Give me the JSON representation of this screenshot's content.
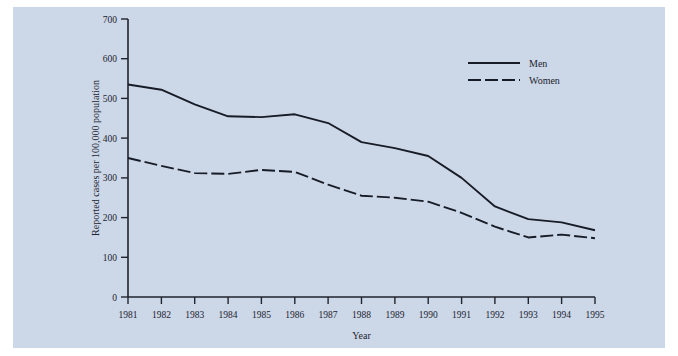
{
  "chart_data": {
    "type": "line",
    "title": "",
    "xlabel": "Year",
    "ylabel": "Reported cases per 100,000 population",
    "x": [
      1981,
      1982,
      1983,
      1984,
      1985,
      1986,
      1987,
      1988,
      1989,
      1990,
      1991,
      1992,
      1993,
      1994,
      1995
    ],
    "xtick_labels": [
      "1981",
      "1982",
      "1983",
      "1984",
      "1985",
      "1986",
      "1987",
      "1988",
      "1989",
      "1990",
      "1991",
      "1992",
      "1993",
      "1994",
      "1995"
    ],
    "ytick_labels": [
      "0",
      "100",
      "200",
      "300",
      "400",
      "500",
      "600",
      "700"
    ],
    "yticks": [
      0,
      100,
      200,
      300,
      400,
      500,
      600,
      700
    ],
    "ylim": [
      0,
      700
    ],
    "xlim": [
      1981,
      1995
    ],
    "grid": false,
    "legend_position": "top-right",
    "series": [
      {
        "name": "Men",
        "style": "solid",
        "values": [
          535,
          522,
          485,
          455,
          453,
          460,
          438,
          390,
          375,
          355,
          300,
          228,
          196,
          188,
          168
        ]
      },
      {
        "name": "Women",
        "style": "dashed",
        "values": [
          350,
          330,
          312,
          310,
          320,
          315,
          283,
          255,
          250,
          240,
          212,
          177,
          150,
          157,
          148
        ]
      }
    ]
  },
  "legend": {
    "items": [
      {
        "label": "Men",
        "style": "solid"
      },
      {
        "label": "Women",
        "style": "dashed"
      }
    ]
  },
  "colors": {
    "panel_background": "#ccd7e7",
    "page_background": "#ffffff",
    "ink": "#171c27"
  }
}
